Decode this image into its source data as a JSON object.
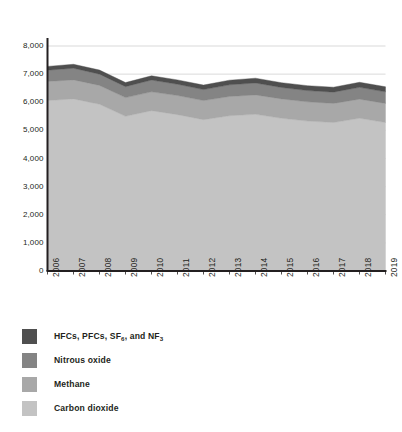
{
  "chart_data": {
    "type": "area",
    "stacked": true,
    "title": "",
    "subtitle": "",
    "xlabel": "",
    "ylabel": "",
    "x": [
      2006,
      2007,
      2008,
      2009,
      2010,
      2011,
      2012,
      2013,
      2014,
      2015,
      2016,
      2017,
      2018,
      2019
    ],
    "categories": [
      "2006",
      "2007",
      "2008",
      "2009",
      "2010",
      "2011",
      "2012",
      "2013",
      "2014",
      "2015",
      "2016",
      "2017",
      "2018",
      "2019"
    ],
    "xlim": [
      2006,
      2019
    ],
    "ylim": [
      0,
      8000
    ],
    "ytick_values": [
      0,
      1000,
      2000,
      3000,
      4000,
      5000,
      6000,
      7000,
      8000
    ],
    "ytick_labels": [
      "0",
      "1,000",
      "2,000",
      "3,000",
      "4,000",
      "5,000",
      "6,000",
      "7,000",
      "8,000"
    ],
    "grid": true,
    "grid_axis": "y",
    "legend_position": "below-left",
    "stack_order_bottom_to_top": [
      "Carbon dioxide",
      "Methane",
      "Nitrous oxide",
      "HFCs, PFCs, SF6, and NF3"
    ],
    "series": [
      {
        "name": "Carbon dioxide",
        "color": "#c3c3c3",
        "values": [
          6060,
          6120,
          5930,
          5500,
          5700,
          5560,
          5380,
          5520,
          5570,
          5430,
          5330,
          5280,
          5430,
          5280
        ]
      },
      {
        "name": "Methane",
        "color": "#a8a8a8",
        "values": [
          680,
          675,
          670,
          665,
          670,
          680,
          680,
          685,
          690,
          690,
          685,
          680,
          680,
          680
        ]
      },
      {
        "name": "Nitrous oxide",
        "color": "#848484",
        "values": [
          400,
          415,
          400,
          390,
          420,
          400,
          390,
          415,
          425,
          405,
          400,
          400,
          420,
          410
        ]
      },
      {
        "name": "HFCs, PFCs, SF6, and NF3",
        "color": "#4f4f4f",
        "values": [
          135,
          140,
          145,
          145,
          150,
          155,
          160,
          165,
          170,
          170,
          175,
          175,
          180,
          180
        ]
      }
    ],
    "totals": [
      7275,
      7350,
      7145,
      6700,
      6940,
      6795,
      6610,
      6785,
      6855,
      6695,
      6590,
      6535,
      6710,
      6550
    ]
  },
  "axes": {
    "ytick_labels": [
      "8,000",
      "7,000",
      "6,000",
      "5,000",
      "4,000",
      "3,000",
      "2,000",
      "1,000",
      "0"
    ],
    "xtick_labels": [
      "2006",
      "2007",
      "2008",
      "2009",
      "2010",
      "2011",
      "2012",
      "2013",
      "2014",
      "2015",
      "2016",
      "2017",
      "2018",
      "2019"
    ]
  },
  "legend": {
    "items": [
      {
        "label_prefix": "HFCs, PFCs, SF",
        "sub1": "6",
        "label_mid": ", and NF",
        "sub2": "3",
        "label_suffix": "",
        "color": "#4f4f4f",
        "name": "fluorinated-gases"
      },
      {
        "label_prefix": "Nitrous oxide",
        "sub1": "",
        "label_mid": "",
        "sub2": "",
        "label_suffix": "",
        "color": "#848484",
        "name": "nitrous-oxide"
      },
      {
        "label_prefix": "Methane",
        "sub1": "",
        "label_mid": "",
        "sub2": "",
        "label_suffix": "",
        "color": "#a8a8a8",
        "name": "methane"
      },
      {
        "label_prefix": "Carbon dioxide",
        "sub1": "",
        "label_mid": "",
        "sub2": "",
        "label_suffix": "",
        "color": "#c3c3c3",
        "name": "carbon-dioxide"
      }
    ]
  },
  "colors": {
    "axis": "#231f20",
    "grid": "#c9c9c9",
    "background": "#ffffff"
  }
}
